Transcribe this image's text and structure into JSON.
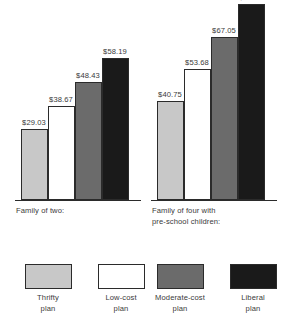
{
  "chart_data": {
    "type": "bar",
    "title": "",
    "xlabel": "",
    "ylabel": "",
    "grid": false,
    "legend_position": "bottom",
    "categories": [
      "Family of two:",
      "Family of four with\npre-school children:"
    ],
    "series": [
      {
        "name": "Thrifty plan",
        "color": "#c8c8c8",
        "values": [
          29.03,
          40.75
        ],
        "labels": [
          "$29.03",
          "$40.75"
        ]
      },
      {
        "name": "Low-cost plan",
        "color": "#ffffff",
        "values": [
          38.67,
          53.68
        ],
        "labels": [
          "$38.67",
          "$53.68"
        ]
      },
      {
        "name": "Moderate-cost plan",
        "color": "#6b6b6b",
        "values": [
          48.43,
          67.05
        ],
        "labels": [
          "$48.43",
          "$67.05"
        ]
      },
      {
        "name": "Liberal plan",
        "color": "#1a1a1a",
        "values": [
          58.19,
          80.52
        ],
        "labels": [
          "$58.19",
          "$80.52"
        ]
      }
    ],
    "ylim": [
      0,
      82
    ]
  },
  "groups": [
    {
      "caption": "Family of two:",
      "bars": [
        {
          "label": "$29.03",
          "value": 29.03,
          "plan": "Thrifty plan",
          "color": "#c8c8c8"
        },
        {
          "label": "$38.67",
          "value": 38.67,
          "plan": "Low-cost plan",
          "color": "#ffffff"
        },
        {
          "label": "$48.43",
          "value": 48.43,
          "plan": "Moderate-cost plan",
          "color": "#6b6b6b"
        },
        {
          "label": "$58.19",
          "value": 58.19,
          "plan": "Liberal plan",
          "color": "#1a1a1a"
        }
      ]
    },
    {
      "caption": "Family of four with\npre-school children:",
      "bars": [
        {
          "label": "$40.75",
          "value": 40.75,
          "plan": "Thrifty plan",
          "color": "#c8c8c8"
        },
        {
          "label": "$53.68",
          "value": 53.68,
          "plan": "Low-cost plan",
          "color": "#ffffff"
        },
        {
          "label": "$67.05",
          "value": 67.05,
          "plan": "Moderate-cost plan",
          "color": "#6b6b6b"
        },
        {
          "label": "$80.52",
          "value": 80.52,
          "plan": "Liberal plan",
          "color": "#1a1a1a"
        }
      ]
    }
  ],
  "legend": {
    "items": [
      {
        "label": "Thrifty\nplan",
        "color": "#c8c8c8"
      },
      {
        "label": "Low-cost\nplan",
        "color": "#ffffff"
      },
      {
        "label": "Moderate-cost\nplan",
        "color": "#6b6b6b"
      },
      {
        "label": "Liberal\nplan",
        "color": "#1a1a1a"
      }
    ]
  },
  "colors": {
    "thrifty": "#c8c8c8",
    "low_cost": "#ffffff",
    "moderate_cost": "#6b6b6b",
    "liberal": "#1a1a1a",
    "outline": "#2b2b2b",
    "text": "#3a3a3a",
    "background": "#ffffff"
  }
}
